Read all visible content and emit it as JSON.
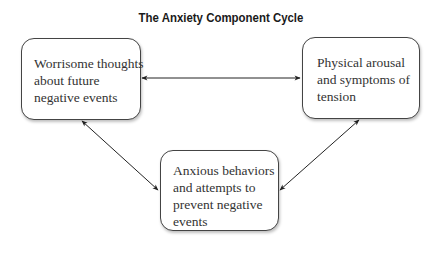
{
  "title": "The Anxiety Component Cycle",
  "nodes": {
    "thoughts": {
      "lines": [
        "Worrisome thoughts",
        "about future",
        "negative events"
      ]
    },
    "physical": {
      "lines": [
        "Physical arousal",
        "and symptoms of",
        "tension"
      ]
    },
    "behaviors": {
      "lines": [
        "Anxious behaviors",
        "and attempts to",
        "prevent negative",
        "events"
      ]
    }
  },
  "edges": [
    {
      "from": "thoughts",
      "to": "physical",
      "direction": "bidirectional"
    },
    {
      "from": "thoughts",
      "to": "behaviors",
      "direction": "bidirectional"
    },
    {
      "from": "physical",
      "to": "behaviors",
      "direction": "bidirectional"
    }
  ],
  "colors": {
    "stroke": "#222222",
    "text": "#333333",
    "title": "#1a1a1a"
  }
}
